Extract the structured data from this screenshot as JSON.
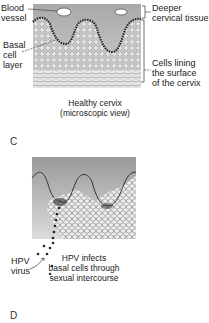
{
  "panel_c": {
    "labels": {
      "blood_vessel_1": "Blood",
      "blood_vessel_2": "vessel",
      "deeper_1": "Deeper",
      "deeper_2": "cervical tissue",
      "basal_1": "Basal",
      "basal_2": "cell",
      "basal_3": "layer",
      "cells_1": "Cells lining",
      "cells_2": "the surface",
      "cells_3": "of the cervix"
    },
    "caption_1": "Healthy cervix",
    "caption_2": "(microscopic view)",
    "letter": "C"
  },
  "panel_d": {
    "labels": {
      "hpv_1": "HPV",
      "hpv_2": "virus",
      "infects_1": "HPV infects",
      "infects_2": "basal cells through",
      "infects_3": "sexual intercourse"
    },
    "letter": "D"
  }
}
